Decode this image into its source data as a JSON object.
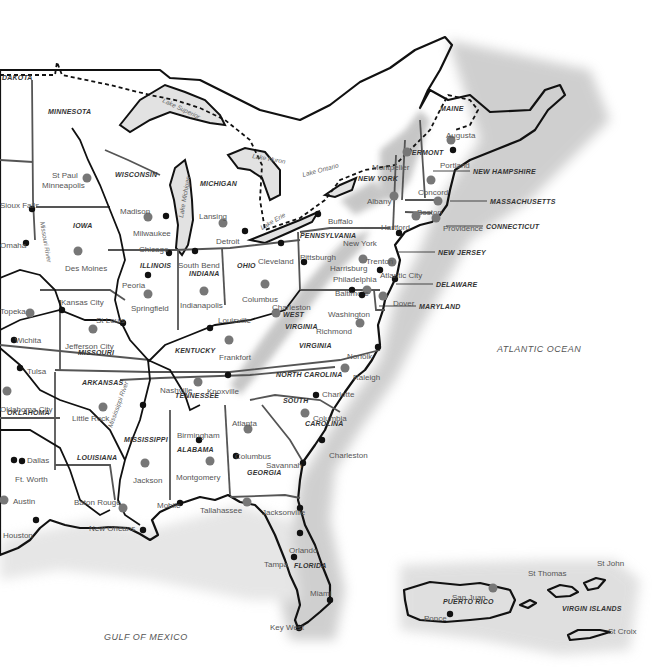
{
  "map": {
    "title": "Eastern United States",
    "colors": {
      "land": "#ffffff",
      "water_shade": "#bdbdbd",
      "capital_dot": "#777777",
      "city_dot": "#111111",
      "mountains": "#bcbcbc"
    },
    "states": [
      {
        "name": "DAKOTA",
        "x": 2,
        "y": 80
      },
      {
        "name": "MINNESOTA",
        "x": 48,
        "y": 114
      },
      {
        "name": "WISCONSIN",
        "x": 115,
        "y": 177
      },
      {
        "name": "MICHIGAN",
        "x": 200,
        "y": 186
      },
      {
        "name": "IOWA",
        "x": 73,
        "y": 228
      },
      {
        "name": "ILLINOIS",
        "x": 140,
        "y": 268
      },
      {
        "name": "INDIANA",
        "x": 189,
        "y": 276
      },
      {
        "name": "OHIO",
        "x": 237,
        "y": 268
      },
      {
        "name": "NEW YORK",
        "x": 358,
        "y": 181
      },
      {
        "name": "PENNSYLVANIA",
        "x": 300,
        "y": 238
      },
      {
        "name": "MAINE",
        "x": 440,
        "y": 111
      },
      {
        "name": "MISSOURI",
        "x": 78,
        "y": 355
      },
      {
        "name": "KENTUCKY",
        "x": 175,
        "y": 353
      },
      {
        "name": "VIRGINIA",
        "x": 299,
        "y": 348
      },
      {
        "name": "ARKANSAS",
        "x": 82,
        "y": 385
      },
      {
        "name": "TENNESSEE",
        "x": 175,
        "y": 398
      },
      {
        "name": "NORTH CAROLINA",
        "x": 276,
        "y": 377
      },
      {
        "name": "OKLAHOMA",
        "x": 7,
        "y": 415
      },
      {
        "name": "MISSISSIPPI",
        "x": 124,
        "y": 442
      },
      {
        "name": "ALABAMA",
        "x": 177,
        "y": 452
      },
      {
        "name": "SOUTH",
        "x": 283,
        "y": 403
      },
      {
        "name": "CAROLINA",
        "x": 305,
        "y": 426
      },
      {
        "name": "GEORGIA",
        "x": 247,
        "y": 475
      },
      {
        "name": "LOUISIANA",
        "x": 77,
        "y": 460
      },
      {
        "name": "FLORIDA",
        "x": 294,
        "y": 568
      },
      {
        "name": "WEST",
        "x": 283,
        "y": 317
      },
      {
        "name": "VIRGINIA",
        "x": 285,
        "y": 329
      },
      {
        "name": "VERMONT",
        "x": 407,
        "y": 155
      },
      {
        "name": "PUERTO RICO",
        "x": 443,
        "y": 604
      },
      {
        "name": "VIRGIN ISLANDS",
        "x": 562,
        "y": 611
      }
    ],
    "callouts": [
      {
        "name": "NEW HAMPSHIRE",
        "x": 473,
        "y": 174
      },
      {
        "name": "MASSACHUSETTS",
        "x": 490,
        "y": 204
      },
      {
        "name": "CONNECTICUT",
        "x": 486,
        "y": 229
      },
      {
        "name": "NEW JERSEY",
        "x": 438,
        "y": 255
      },
      {
        "name": "DELAWARE",
        "x": 436,
        "y": 287
      },
      {
        "name": "MARYLAND",
        "x": 419,
        "y": 309
      }
    ],
    "capitals": [
      {
        "name": "Minneapolis",
        "label": "St Paul",
        "x": 87,
        "y": 178,
        "lx": 52,
        "ly": 170
      },
      {
        "name": "Madison",
        "x": 148,
        "y": 217,
        "lx": 120,
        "ly": 206
      },
      {
        "name": "Lansing",
        "x": 223,
        "y": 223,
        "lx": 199,
        "ly": 211
      },
      {
        "name": "Des Moines",
        "x": 78,
        "y": 251,
        "lx": 65,
        "ly": 263
      },
      {
        "name": "Springfield",
        "x": 148,
        "y": 294,
        "lx": 131,
        "ly": 303
      },
      {
        "name": "Indianapolis",
        "x": 204,
        "y": 291,
        "lx": 180,
        "ly": 300
      },
      {
        "name": "Columbus",
        "x": 265,
        "y": 284,
        "lx": 242,
        "ly": 294
      },
      {
        "name": "Albany",
        "x": 394,
        "y": 196,
        "lx": 367,
        "ly": 196
      },
      {
        "name": "Montpelier",
        "x": 407,
        "y": 152,
        "lx": 372,
        "ly": 162
      },
      {
        "name": "Augusta",
        "x": 451,
        "y": 140,
        "lx": 446,
        "ly": 130
      },
      {
        "name": "Concord",
        "x": 431,
        "y": 180,
        "lx": 418,
        "ly": 187
      },
      {
        "name": "Boston",
        "x": 438,
        "y": 201,
        "lx": 417,
        "ly": 207
      },
      {
        "name": "Hartford",
        "x": 416,
        "y": 216,
        "lx": 381,
        "ly": 222
      },
      {
        "name": "Providence",
        "x": 436,
        "y": 218,
        "lx": 443,
        "ly": 223
      },
      {
        "name": "Harrisburg",
        "x": 363,
        "y": 259,
        "lx": 330,
        "ly": 263
      },
      {
        "name": "Trenton",
        "x": 392,
        "y": 262,
        "lx": 366,
        "ly": 256
      },
      {
        "name": "Dover",
        "x": 383,
        "y": 296,
        "lx": 393,
        "ly": 298
      },
      {
        "name": "Annapolis",
        "x": 367,
        "y": 290,
        "lx": 0,
        "ly": 0,
        "hidden": true
      },
      {
        "name": "Richmond",
        "x": 360,
        "y": 323,
        "lx": 316,
        "ly": 326
      },
      {
        "name": "Charleston",
        "label": "Charleston",
        "x": 276,
        "y": 313,
        "lx": 272,
        "ly": 302
      },
      {
        "name": "Frankfort",
        "x": 229,
        "y": 340,
        "lx": 219,
        "ly": 352
      },
      {
        "name": "Jefferson City",
        "x": 93,
        "y": 329,
        "lx": 65,
        "ly": 341
      },
      {
        "name": "Topeka",
        "x": 30,
        "y": 313,
        "lx": 0,
        "ly": 306
      },
      {
        "name": "Oklahoma City",
        "x": 7,
        "y": 391,
        "lx": 0,
        "ly": 404
      },
      {
        "name": "Little Rock",
        "x": 103,
        "y": 407,
        "lx": 72,
        "ly": 413
      },
      {
        "name": "Nashville",
        "x": 198,
        "y": 382,
        "lx": 160,
        "ly": 385
      },
      {
        "name": "Raleigh",
        "x": 345,
        "y": 368,
        "lx": 353,
        "ly": 372
      },
      {
        "name": "Columbia",
        "x": 305,
        "y": 413,
        "lx": 313,
        "ly": 413
      },
      {
        "name": "Atlanta",
        "x": 248,
        "y": 429,
        "lx": 232,
        "ly": 418
      },
      {
        "name": "Montgomery",
        "x": 210,
        "y": 461,
        "lx": 176,
        "ly": 472
      },
      {
        "name": "Jackson",
        "x": 145,
        "y": 463,
        "lx": 133,
        "ly": 475
      },
      {
        "name": "Baton Rouge",
        "x": 123,
        "y": 508,
        "lx": 74,
        "ly": 497
      },
      {
        "name": "Austin",
        "x": 4,
        "y": 500,
        "lx": 13,
        "ly": 496
      },
      {
        "name": "Tallahassee",
        "x": 247,
        "y": 502,
        "lx": 200,
        "ly": 505
      },
      {
        "name": "San Juan",
        "x": 493,
        "y": 588,
        "lx": 452,
        "ly": 592
      }
    ],
    "cities": [
      {
        "name": "Sioux Falls",
        "x": 32,
        "y": 209,
        "lx": 0,
        "ly": 200
      },
      {
        "name": "Omaha",
        "x": 26,
        "y": 243,
        "lx": 0,
        "ly": 240
      },
      {
        "name": "Milwaukee",
        "x": 166,
        "y": 216,
        "lx": 133,
        "ly": 228
      },
      {
        "name": "Chicago",
        "x": 169,
        "y": 253,
        "lx": 139,
        "ly": 244
      },
      {
        "name": "Peoria",
        "x": 148,
        "y": 275,
        "lx": 122,
        "ly": 280
      },
      {
        "name": "South Bend",
        "x": 195,
        "y": 251,
        "lx": 178,
        "ly": 260
      },
      {
        "name": "Detroit",
        "x": 245,
        "y": 231,
        "lx": 216,
        "ly": 236
      },
      {
        "name": "Cleveland",
        "x": 281,
        "y": 243,
        "lx": 258,
        "ly": 256
      },
      {
        "name": "Buffalo",
        "x": 318,
        "y": 214,
        "lx": 328,
        "ly": 216
      },
      {
        "name": "Pittsburgh",
        "x": 304,
        "y": 262,
        "lx": 300,
        "ly": 252
      },
      {
        "name": "New York",
        "x": 399,
        "y": 233,
        "lx": 343,
        "ly": 238
      },
      {
        "name": "Philadelphia",
        "x": 380,
        "y": 270,
        "lx": 333,
        "ly": 274
      },
      {
        "name": "Atlantic City",
        "x": 395,
        "y": 279,
        "lx": 380,
        "ly": 270
      },
      {
        "name": "Baltimore",
        "x": 352,
        "y": 290,
        "lx": 335,
        "ly": 288
      },
      {
        "name": "Washington",
        "x": 362,
        "y": 295,
        "lx": 328,
        "ly": 309
      },
      {
        "name": "Portland",
        "x": 453,
        "y": 150,
        "lx": 440,
        "ly": 160
      },
      {
        "name": "Norfolk",
        "x": 378,
        "y": 347,
        "lx": 347,
        "ly": 351
      },
      {
        "name": "Kansas City",
        "x": 62,
        "y": 310,
        "lx": 61,
        "ly": 297
      },
      {
        "name": "St Louis",
        "x": 123,
        "y": 323,
        "lx": 96,
        "ly": 315
      },
      {
        "name": "Louisville",
        "x": 210,
        "y": 328,
        "lx": 218,
        "ly": 315
      },
      {
        "name": "Wichita",
        "x": 14,
        "y": 340,
        "lx": 15,
        "ly": 335
      },
      {
        "name": "Tulsa",
        "x": 20,
        "y": 368,
        "lx": 27,
        "ly": 366
      },
      {
        "name": "Knoxville",
        "x": 228,
        "y": 375,
        "lx": 207,
        "ly": 386
      },
      {
        "name": "Memphis",
        "x": 143,
        "y": 405,
        "lx": 0,
        "ly": 0,
        "hidden": true
      },
      {
        "name": "Charlotte",
        "x": 316,
        "y": 395,
        "lx": 322,
        "ly": 389
      },
      {
        "name": "Birmingham",
        "x": 199,
        "y": 440,
        "lx": 177,
        "ly": 430
      },
      {
        "name": "Columbus",
        "x": 236,
        "y": 456,
        "lx": 235,
        "ly": 451
      },
      {
        "name": "Savannah",
        "x": 303,
        "y": 463,
        "lx": 266,
        "ly": 460
      },
      {
        "name": "Charleston",
        "x": 322,
        "y": 440,
        "lx": 329,
        "ly": 450
      },
      {
        "name": "Dallas",
        "x": 14,
        "y": 460,
        "lx": 27,
        "ly": 455
      },
      {
        "name": "Ft. Worth",
        "x": 22,
        "y": 461,
        "lx": 15,
        "ly": 474
      },
      {
        "name": "Houston",
        "x": 36,
        "y": 520,
        "lx": 3,
        "ly": 530
      },
      {
        "name": "New Orleans",
        "x": 143,
        "y": 530,
        "lx": 89,
        "ly": 523
      },
      {
        "name": "Mobile",
        "x": 180,
        "y": 503,
        "lx": 157,
        "ly": 500
      },
      {
        "name": "Jacksonville",
        "x": 300,
        "y": 508,
        "lx": 262,
        "ly": 507
      },
      {
        "name": "Orlando",
        "x": 300,
        "y": 533,
        "lx": 289,
        "ly": 545
      },
      {
        "name": "Tampa",
        "x": 294,
        "y": 557,
        "lx": 264,
        "ly": 559
      },
      {
        "name": "Miami",
        "x": 330,
        "y": 600,
        "lx": 310,
        "ly": 588
      },
      {
        "name": "Key West",
        "x": 299,
        "y": 628,
        "lx": 270,
        "ly": 622
      },
      {
        "name": "Ponce",
        "x": 450,
        "y": 614,
        "lx": 424,
        "ly": 613
      }
    ],
    "water_labels": [
      {
        "name": "Lake Superior",
        "x": 162,
        "y": 102,
        "rot": 25
      },
      {
        "name": "Lake Huron",
        "x": 252,
        "y": 158,
        "rot": 10
      },
      {
        "name": "Lake Ontario",
        "x": 303,
        "y": 177,
        "rot": -15
      },
      {
        "name": "Lake Michigan",
        "x": 183,
        "y": 218,
        "rot": -80
      },
      {
        "name": "Lake Erie",
        "x": 262,
        "y": 230,
        "rot": -30
      },
      {
        "name": "Missouri River",
        "x": 40,
        "y": 222,
        "rot": 80
      },
      {
        "name": "Mississippi River",
        "x": 112,
        "y": 428,
        "rot": -70
      }
    ],
    "island_labels": [
      {
        "name": "St Thomas",
        "x": 528,
        "y": 576
      },
      {
        "name": "St John",
        "x": 597,
        "y": 566
      },
      {
        "name": "St Croix",
        "x": 608,
        "y": 634
      }
    ],
    "oceans": [
      {
        "name": "ATLANTIC OCEAN",
        "x": 497,
        "y": 352
      },
      {
        "name": "GULF OF MEXICO",
        "x": 104,
        "y": 640
      }
    ]
  }
}
